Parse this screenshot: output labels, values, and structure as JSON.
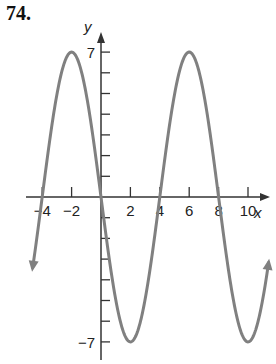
{
  "problem_number": "74.",
  "chart_data": {
    "type": "line",
    "title": "",
    "xlabel": "x",
    "ylabel": "y",
    "function": "y = -7 sin(pi x / 4)",
    "x_ticks": [
      -4,
      -2,
      2,
      4,
      6,
      8,
      10
    ],
    "x_tick_labels": [
      "−4",
      "−2",
      "2",
      "4",
      "6",
      "8",
      "10"
    ],
    "y_tick_labels": [
      "7",
      "−7"
    ],
    "y_ticks": [
      -7,
      -6,
      -5,
      -4,
      -3,
      -2,
      -1,
      1,
      2,
      3,
      4,
      5,
      6,
      7
    ],
    "xlim": [
      -5,
      11
    ],
    "ylim": [
      -7.5,
      7.5
    ],
    "key_points": [
      {
        "x": -4,
        "y": 0
      },
      {
        "x": -2,
        "y": 7
      },
      {
        "x": 0,
        "y": 0
      },
      {
        "x": 2,
        "y": -7
      },
      {
        "x": 4,
        "y": 0
      },
      {
        "x": 6,
        "y": 7
      },
      {
        "x": 8,
        "y": 0
      },
      {
        "x": 10,
        "y": -7
      }
    ],
    "amplitude": 7,
    "period": 8,
    "grid": false,
    "curve_color": "#808080",
    "axis_color": "#333333"
  }
}
